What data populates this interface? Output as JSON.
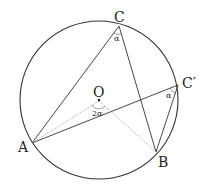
{
  "diagram": {
    "points": {
      "A": {
        "label": "A",
        "x": 32,
        "y": 143
      },
      "B": {
        "label": "B",
        "x": 156,
        "y": 152
      },
      "C": {
        "label": "C",
        "x": 119,
        "y": 26
      },
      "C2": {
        "label": "C′",
        "x": 178,
        "y": 85
      },
      "O": {
        "label": "O",
        "x": 99,
        "y": 101
      }
    },
    "angles": {
      "at_C": "α",
      "at_C2": "α",
      "at_O": "2α"
    },
    "circle": {
      "cx": 99,
      "cy": 100,
      "r": 79
    },
    "colors": {
      "line": "#333333",
      "dotted": "#999999"
    }
  }
}
